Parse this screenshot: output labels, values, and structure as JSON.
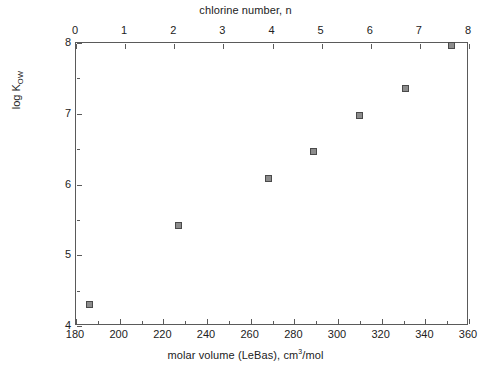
{
  "chart_data": {
    "type": "scatter",
    "title": "",
    "top_axis_title": "chlorine number, n",
    "xlabel_html": "molar volume (LeBas), cm<sup>3</sup>/mol",
    "xlabel": "molar volume (LeBas), cm3/mol",
    "ylabel": "log K",
    "ylabel_sub": "OW",
    "xlim": [
      180,
      360
    ],
    "ylim": [
      4,
      8
    ],
    "top_xlim": [
      0,
      8
    ],
    "xticks": [
      180,
      200,
      220,
      240,
      260,
      280,
      300,
      320,
      340,
      360
    ],
    "xticklabels": [
      "180",
      "200",
      "220",
      "240",
      "260",
      "280",
      "300",
      "320",
      "340",
      "360"
    ],
    "x_minor_ticks": [
      190,
      210,
      230,
      250,
      270,
      290,
      310,
      330,
      350
    ],
    "top_xticks": [
      0,
      1,
      2,
      3,
      4,
      5,
      6,
      7,
      8
    ],
    "top_xticklabels": [
      "0",
      "1",
      "2",
      "3",
      "4",
      "5",
      "6",
      "7",
      "8"
    ],
    "yticks": [
      4,
      5,
      6,
      7,
      8
    ],
    "yticklabels": [
      "4",
      "5",
      "6",
      "7",
      "8"
    ],
    "y_minor_ticks": [
      4.5,
      5.5,
      6.5,
      7.5
    ],
    "grid": false,
    "legend": null,
    "marker": "square",
    "marker_face_color": "#8c8c8c",
    "marker_edge_color": "#4a4a4a",
    "axis_color": "#5a5a5a",
    "background": "#ffffff",
    "x": [
      186,
      227,
      268,
      289,
      310,
      331,
      352
    ],
    "y": [
      4.3,
      5.42,
      6.09,
      6.47,
      6.97,
      7.36,
      7.97
    ],
    "chlorine_number": [
      0,
      2,
      4,
      5,
      6,
      7,
      8
    ],
    "points": [
      {
        "molar_volume": 186,
        "log_kow": 4.3,
        "n": 0
      },
      {
        "molar_volume": 227,
        "log_kow": 5.42,
        "n": 2
      },
      {
        "molar_volume": 268,
        "log_kow": 6.09,
        "n": 4
      },
      {
        "molar_volume": 289,
        "log_kow": 6.47,
        "n": 5
      },
      {
        "molar_volume": 310,
        "log_kow": 6.97,
        "n": 6
      },
      {
        "molar_volume": 331,
        "log_kow": 7.36,
        "n": 7
      },
      {
        "molar_volume": 352,
        "log_kow": 7.97,
        "n": 8
      }
    ]
  }
}
